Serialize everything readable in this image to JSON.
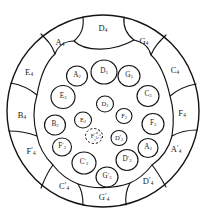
{
  "figure": {
    "kind": "nested-circle-packing-diagram",
    "title": "",
    "background": "#ffffff",
    "stroke_color": "#141414",
    "canvas": {
      "width": 206,
      "height": 222
    }
  },
  "boundary": {
    "name": "outer-boundary-circle",
    "cx": 103,
    "cy": 111,
    "r": 96,
    "stroke_width": 1.3,
    "dashed": false
  },
  "chart_data": {
    "type": "diagram",
    "title": "",
    "rings": [
      {
        "name": "outer-ring",
        "label_size": "s-outer",
        "cells": 14
      },
      {
        "name": "ring-2",
        "label_size": "s-mid",
        "cells": 10
      },
      {
        "name": "ring-3",
        "label_size": "s-inner",
        "cells": 8
      },
      {
        "name": "core",
        "label_size": "s-core",
        "cells": 3
      }
    ],
    "labels": [
      "D4",
      "A4",
      "G4",
      "C4",
      "F4",
      "A'4",
      "D'4",
      "G'4",
      "C'4",
      "F'4",
      "B4",
      "E4",
      "A2",
      "D3",
      "G3",
      "C3",
      "E3",
      "B2",
      "F'2",
      "E2",
      "D1",
      "F3",
      "F2",
      "C'2",
      "G'3",
      "D'3",
      "A2r",
      "D'2",
      "F'1"
    ]
  },
  "cells": [
    {
      "id": "outer-D4",
      "label": "D",
      "sub": "4",
      "prime": false,
      "x": 103,
      "y": 28,
      "size": "s-outer",
      "dashed": false
    },
    {
      "id": "outer-A4",
      "label": "A",
      "sub": "4",
      "prime": false,
      "x": 60,
      "y": 42,
      "size": "s-outer",
      "dashed": false
    },
    {
      "id": "outer-G4",
      "label": "G",
      "sub": "4",
      "prime": false,
      "x": 144,
      "y": 41,
      "size": "s-outer",
      "dashed": false
    },
    {
      "id": "outer-E4",
      "label": "E",
      "sub": "4",
      "prime": false,
      "x": 29,
      "y": 72,
      "size": "s-outer",
      "dashed": false
    },
    {
      "id": "outer-C4",
      "label": "C",
      "sub": "4",
      "prime": false,
      "x": 175,
      "y": 70,
      "size": "s-outer",
      "dashed": false
    },
    {
      "id": "outer-B4",
      "label": "B",
      "sub": "4",
      "prime": false,
      "x": 22,
      "y": 115,
      "size": "s-outer",
      "dashed": false
    },
    {
      "id": "outer-F4",
      "label": "F",
      "sub": "4",
      "prime": false,
      "x": 182,
      "y": 113,
      "size": "s-outer",
      "dashed": false
    },
    {
      "id": "outer-Fp4",
      "label": "F",
      "sub": "4",
      "prime": true,
      "x": 31,
      "y": 152,
      "size": "s-outer",
      "dashed": false
    },
    {
      "id": "outer-Ap4",
      "label": "A",
      "sub": "4",
      "prime": true,
      "x": 176,
      "y": 150,
      "size": "s-outer",
      "dashed": false
    },
    {
      "id": "outer-Cp4",
      "label": "C",
      "sub": "4",
      "prime": true,
      "x": 64,
      "y": 187,
      "size": "s-outer",
      "dashed": false
    },
    {
      "id": "outer-Dp4",
      "label": "D",
      "sub": "4",
      "prime": true,
      "x": 148,
      "y": 182,
      "size": "s-outer",
      "dashed": false
    },
    {
      "id": "outer-Gp4",
      "label": "G",
      "sub": "4",
      "prime": true,
      "x": 104,
      "y": 198,
      "size": "s-outer",
      "dashed": false
    },
    {
      "id": "mid-A2",
      "label": "A",
      "sub": "2",
      "prime": false,
      "x": 77,
      "y": 76,
      "size": "s-mid",
      "dashed": false
    },
    {
      "id": "mid-D3",
      "label": "D",
      "sub": "3",
      "prime": false,
      "x": 104,
      "y": 72,
      "size": "s-mid",
      "dashed": false
    },
    {
      "id": "mid-G3",
      "label": "G",
      "sub": "3",
      "prime": false,
      "x": 129,
      "y": 76,
      "size": "s-mid",
      "dashed": false
    },
    {
      "id": "mid-C3",
      "label": "C",
      "sub": "3",
      "prime": false,
      "x": 148,
      "y": 95,
      "size": "s-mid",
      "dashed": false
    },
    {
      "id": "mid-E3",
      "label": "E",
      "sub": "3",
      "prime": false,
      "x": 63,
      "y": 97,
      "size": "s-mid",
      "dashed": false
    },
    {
      "id": "mid-B2",
      "label": "B",
      "sub": "2",
      "prime": false,
      "x": 55,
      "y": 125,
      "size": "s-mid",
      "dashed": false
    },
    {
      "id": "mid-F3",
      "label": "F",
      "sub": "3",
      "prime": false,
      "x": 153,
      "y": 124,
      "size": "s-mid",
      "dashed": false
    },
    {
      "id": "mid-Fp2",
      "label": "F",
      "sub": "2",
      "prime": true,
      "x": 62,
      "y": 147,
      "size": "s-mid",
      "dashed": false
    },
    {
      "id": "mid-A2r",
      "label": "A",
      "sub": "2",
      "prime": false,
      "x": 148,
      "y": 148,
      "size": "s-mid",
      "dashed": false
    },
    {
      "id": "mid-Cp2",
      "label": "C",
      "sub": "2",
      "prime": true,
      "x": 84,
      "y": 163,
      "size": "s-mid",
      "dashed": false
    },
    {
      "id": "mid-Dp3",
      "label": "D",
      "sub": "3",
      "prime": true,
      "x": 127,
      "y": 160,
      "size": "s-mid",
      "dashed": false
    },
    {
      "id": "mid-Gp3",
      "label": "G",
      "sub": "3",
      "prime": true,
      "x": 107,
      "y": 177,
      "size": "s-mid",
      "dashed": false
    },
    {
      "id": "in-D1",
      "label": "D",
      "sub": "1",
      "prime": false,
      "x": 105,
      "y": 104,
      "size": "s-inner",
      "dashed": false
    },
    {
      "id": "in-E2",
      "label": "E",
      "sub": "2",
      "prime": false,
      "x": 83,
      "y": 120,
      "size": "s-inner",
      "dashed": false
    },
    {
      "id": "in-F2",
      "label": "F",
      "sub": "2",
      "prime": false,
      "x": 124,
      "y": 116,
      "size": "s-inner",
      "dashed": false
    },
    {
      "id": "in-Dp2",
      "label": "D",
      "sub": "2",
      "prime": true,
      "x": 119,
      "y": 138,
      "size": "s-inner",
      "dashed": false
    },
    {
      "id": "in-Fp1",
      "label": "F",
      "sub": "1",
      "prime": true,
      "x": 94,
      "y": 136,
      "size": "s-core",
      "dashed": true
    }
  ]
}
